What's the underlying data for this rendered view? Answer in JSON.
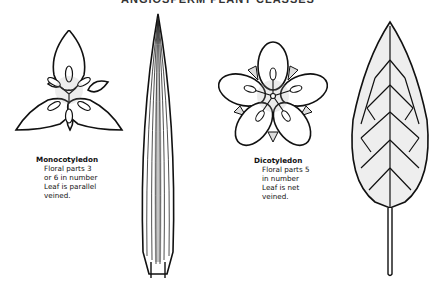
{
  "title": "ANGIOSPERM PLANT CLASSES",
  "monocot": {
    "heading": "Monocotyledon",
    "lines": [
      "Floral parts 3",
      "or 6 in number",
      "Leaf is parallel",
      "veined."
    ]
  },
  "dicot": {
    "heading": "Dicotyledon",
    "lines": [
      "Floral parts 5",
      "in number",
      "Leaf is net",
      "veined."
    ]
  },
  "figures": [
    {
      "name": "monocot-flower",
      "petals": 3,
      "sepals": 3
    },
    {
      "name": "monocot-leaf",
      "venation": "parallel"
    },
    {
      "name": "dicot-flower",
      "petals": 5,
      "sepals": 5
    },
    {
      "name": "dicot-leaf",
      "venation": "net"
    }
  ],
  "colors": {
    "ink": "#111111",
    "stipple": "#9a9a9a",
    "background": "#ffffff"
  }
}
